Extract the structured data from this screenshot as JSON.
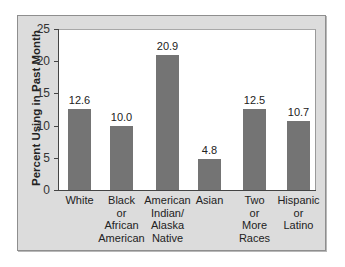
{
  "chart_data": {
    "type": "bar",
    "title": "",
    "xlabel": "",
    "ylabel": "Percent Using in Past Month",
    "ylim": [
      0,
      25
    ],
    "yticks": [
      "0",
      "5",
      "10",
      "15",
      "20",
      "25"
    ],
    "grid": false,
    "legend": null,
    "categories": [
      "White",
      "Black or African American",
      "American Indian/ Alaska Native",
      "Asian",
      "Two or More Races",
      "Hispanic or Latino"
    ],
    "category_labels_display": [
      "White",
      "Black\nor\nAfrican\nAmerican",
      "American\nIndian/\nAlaska\nNative",
      "Asian",
      "Two\nor\nMore\nRaces",
      "Hispanic\nor\nLatino"
    ],
    "values": [
      12.6,
      10.0,
      20.9,
      4.8,
      12.5,
      10.7
    ],
    "value_labels": [
      "12.6",
      "10.0",
      "20.9",
      "4.8",
      "12.5",
      "10.7"
    ],
    "bar_color": "#747474"
  }
}
